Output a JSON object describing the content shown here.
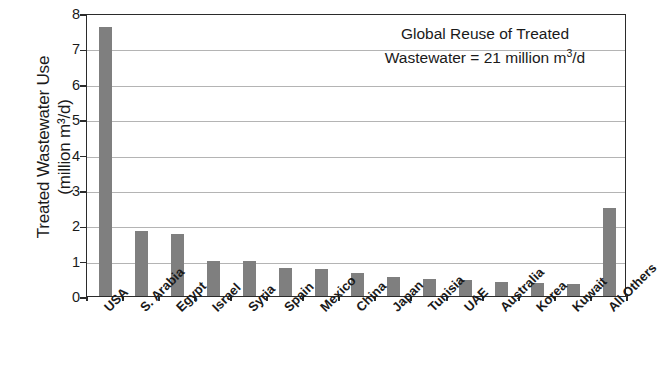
{
  "chart_data": {
    "type": "bar",
    "title": "",
    "xlabel": "",
    "ylabel_line1": "Treated Wastewater Use",
    "ylabel_line2": "(million m³/d)",
    "ylim": [
      0,
      8
    ],
    "ytick_labels": [
      "0",
      "1",
      "2",
      "3",
      "4",
      "5",
      "6",
      "7",
      "8"
    ],
    "ytick_values": [
      0,
      1,
      2,
      3,
      4,
      5,
      6,
      7,
      8
    ],
    "grid": true,
    "grid_axis": "y",
    "legend": "none",
    "bar_color": "#7f7f7f",
    "axis_color": "#2b2b2b",
    "grid_color": "#b4b4b4",
    "categories": [
      "USA",
      "S. Arabia",
      "Egypt",
      "Israel",
      "Syria",
      "Spain",
      "Mexico",
      "China",
      "Japan",
      "Tunisia",
      "UAE",
      "Australia",
      "Korea",
      "Kuwait",
      "All Others"
    ],
    "values": [
      7.6,
      1.85,
      1.75,
      1.0,
      1.0,
      0.8,
      0.75,
      0.65,
      0.55,
      0.48,
      0.45,
      0.4,
      0.37,
      0.35,
      2.5
    ],
    "annotation_line1": "Global Reuse of Treated",
    "annotation_line2_pre": "Wastewater = 21 million m",
    "annotation_line2_sup": "3",
    "annotation_line2_post": "/d",
    "caption": ""
  }
}
